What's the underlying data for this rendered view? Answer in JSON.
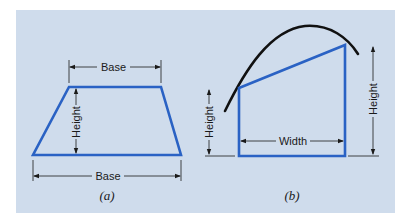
{
  "figure": {
    "background_color": "#cfdcec",
    "shape_color": "#2a62c4",
    "curve_color": "#111111",
    "panel_a": {
      "caption": "(a)",
      "shape": "trapezoid",
      "labels": {
        "top_base": "Base",
        "bottom_base": "Base",
        "height": "Height"
      }
    },
    "panel_b": {
      "caption": "(b)",
      "shape": "trapezoid under curve",
      "labels": {
        "left_height": "Height",
        "right_height": "Height",
        "width": "Width"
      }
    }
  }
}
